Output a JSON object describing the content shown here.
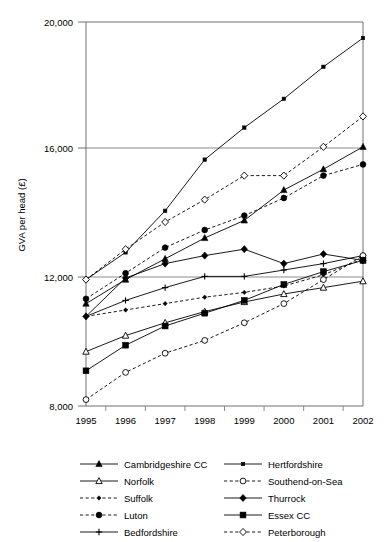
{
  "chart_data": {
    "type": "line",
    "title": "",
    "subtitle": "",
    "xlabel": "",
    "ylabel": "GVA per head (£)",
    "categories": [
      "1995",
      "1996",
      "1997",
      "1998",
      "1999",
      "2000",
      "2001",
      "2002"
    ],
    "x": [
      1995,
      1996,
      1997,
      1998,
      1999,
      2000,
      2001,
      2002
    ],
    "xlim": [
      1995,
      2002
    ],
    "ylim": [
      8000,
      20000
    ],
    "ytick_labels": [
      "8,000",
      "12,000",
      "16,000",
      "20,000"
    ],
    "yticks": [
      8000,
      12000,
      16000,
      20000
    ],
    "grid": "horizontal",
    "legend_position": "bottom",
    "legend_columns": 2,
    "series": [
      {
        "name": "Cambridgeshire CC",
        "marker": "filled-triangle",
        "line": "solid",
        "column": "left",
        "values": [
          11200,
          11950,
          12600,
          13250,
          13800,
          14750,
          15400,
          16100
        ]
      },
      {
        "name": "Norfolk",
        "marker": "open-triangle",
        "line": "solid",
        "column": "left",
        "values": [
          9700,
          10200,
          10600,
          10950,
          11250,
          11500,
          11700,
          11900
        ]
      },
      {
        "name": "Suffolk",
        "marker": "small-filled-diamond",
        "line": "dashed",
        "column": "left",
        "values": [
          10800,
          11000,
          11200,
          11400,
          11550,
          11750,
          12100,
          12600
        ]
      },
      {
        "name": "Luton",
        "marker": "filled-circle",
        "line": "dashed",
        "column": "left",
        "values": [
          11350,
          12150,
          12950,
          13500,
          13950,
          14500,
          15200,
          15550
        ]
      },
      {
        "name": "Bedfordshire",
        "marker": "plus",
        "line": "solid",
        "column": "left",
        "values": [
          10800,
          11300,
          11700,
          12050,
          12050,
          12250,
          12450,
          12700
        ]
      },
      {
        "name": "Hertfordshire",
        "marker": "small-filled-square",
        "line": "solid",
        "column": "right",
        "values": [
          11950,
          12800,
          14100,
          15700,
          16700,
          17600,
          18600,
          19500
        ]
      },
      {
        "name": "Southend-on-Sea",
        "marker": "open-circle",
        "line": "dashed",
        "column": "right",
        "values": [
          8200,
          9050,
          9650,
          10050,
          10600,
          11200,
          11950,
          12700
        ]
      },
      {
        "name": "Thurrock",
        "marker": "filled-diamond",
        "line": "solid",
        "column": "right",
        "values": [
          10800,
          12000,
          12450,
          12700,
          12900,
          12450,
          12750,
          12550
        ]
      },
      {
        "name": "Essex CC",
        "marker": "filled-square",
        "line": "solid",
        "column": "right",
        "values": [
          9100,
          9900,
          10500,
          10900,
          11300,
          11800,
          12200,
          12550
        ]
      },
      {
        "name": "Peterborough",
        "marker": "open-diamond",
        "line": "dashed",
        "column": "right",
        "values": [
          11950,
          12900,
          13750,
          14450,
          15200,
          15200,
          16100,
          17050
        ]
      }
    ]
  },
  "axis": {
    "y_title": "GVA per head (£)",
    "y_ticks": [
      "20,000",
      "16,000",
      "12,000",
      "8,000"
    ],
    "x_ticks": [
      "1995",
      "1996",
      "1997",
      "1998",
      "1999",
      "2000",
      "2001",
      "2002"
    ]
  },
  "legend": {
    "left_column": [
      "Cambridgeshire CC",
      "Norfolk",
      "Suffolk",
      "Luton",
      "Bedfordshire"
    ],
    "right_column": [
      "Hertfordshire",
      "Southend-on-Sea",
      "Thurrock",
      "Essex CC",
      "Peterborough"
    ]
  },
  "colors": {
    "ink": "#000000",
    "grid": "#808080",
    "background": "#ffffff"
  }
}
